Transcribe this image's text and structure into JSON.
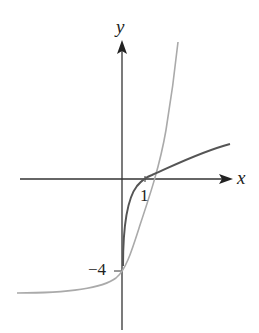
{
  "diagram": {
    "type": "function-graph",
    "axes": {
      "x_label": "x",
      "y_label": "y",
      "x_tick_label": "1",
      "y_tick_label": "−4"
    },
    "curves": [
      {
        "name": "logarithmic-curve",
        "color": "#555555",
        "description": "increasing curve through (1, 0), vertical asymptote near y-axis"
      },
      {
        "name": "exponential-curve",
        "color": "#aaaaaa",
        "description": "increasing curve through (0, −4), horizontal asymptote below"
      }
    ],
    "colors": {
      "axis": "#333333",
      "dark_curve": "#555555",
      "light_curve": "#aaaaaa"
    }
  }
}
